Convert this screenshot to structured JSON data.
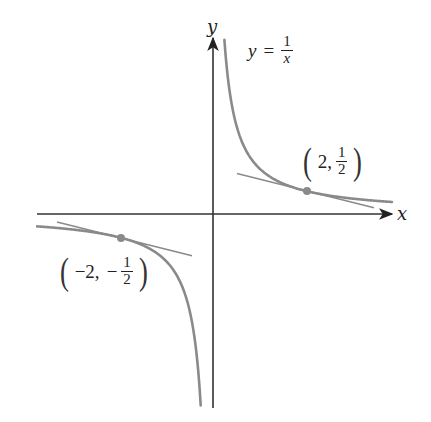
{
  "figure": {
    "colors": {
      "axis": "#333333",
      "curve": "#8a8a8a",
      "tangent": "#8a8a8a",
      "point": "#8a8a8a",
      "text": "#222222"
    },
    "origin_px": [
      212,
      214
    ],
    "scale_px_per_unit": 46.5,
    "axes": {
      "x_label": "x",
      "y_label": "y"
    },
    "function_label": {
      "lhs": "y",
      "eq": "=",
      "numerator": "1",
      "denominator": "x"
    },
    "points": [
      {
        "name": "point-2-half",
        "x": 2,
        "y": 0.5,
        "label_open": "(",
        "label_x": "2,",
        "label_sign": "",
        "label_num": "1",
        "label_den": "2",
        "label_close": ")"
      },
      {
        "name": "point-neg2-neghalf",
        "x": -2,
        "y": -0.5,
        "label_open": "(",
        "label_x": "−2,",
        "label_sign": "−",
        "label_num": "1",
        "label_den": "2",
        "label_close": ")"
      }
    ],
    "tangent_slope": -0.25
  }
}
